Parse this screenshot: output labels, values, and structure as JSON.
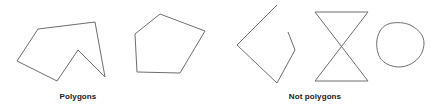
{
  "figure": {
    "width": 437,
    "height": 109,
    "background_color": "#ffffff",
    "stroke_color": "#6e6e6e",
    "text_color": "#1a1a1a"
  },
  "captions": {
    "left": "Polygons",
    "right": "Not polygons"
  },
  "groups": [
    {
      "name": "polygons",
      "caption": "Polygons",
      "shapes": [
        {
          "name": "concave-heptagon",
          "kind": "closed-polygon",
          "closed": true,
          "points": [
            [
              38,
              29
            ],
            [
              95,
              22
            ],
            [
              105,
              77
            ],
            [
              78,
              50
            ],
            [
              57,
              81
            ],
            [
              17,
              61
            ]
          ],
          "path": "M 38 29 L 95 22 L 105 77 L 78 50 L 57 81 L 17 61 Z"
        },
        {
          "name": "convex-pentagon",
          "kind": "closed-polygon",
          "closed": true,
          "points": [
            [
              160,
              14
            ],
            [
              205,
              31
            ],
            [
              180,
              73
            ],
            [
              137,
              72
            ],
            [
              135,
              34
            ]
          ],
          "path": "M 160 14 L 205 31 L 180 73 L 137 72 L 135 34 Z"
        }
      ]
    },
    {
      "name": "not-polygons",
      "caption": "Not polygons",
      "shapes": [
        {
          "name": "open-quadrilateral",
          "kind": "open-figure",
          "closed": false,
          "points": [
            [
              277,
              5
            ],
            [
              237,
              45
            ],
            [
              277,
              83
            ],
            [
              295,
              50
            ],
            [
              288,
              32
            ]
          ],
          "path": "M 277 5 L 237 45 L 277 83 L 295 50 L 288 32"
        },
        {
          "name": "self-intersecting-bowtie",
          "kind": "self-intersecting",
          "closed": true,
          "points": [
            [
              315,
              12
            ],
            [
              368,
              12
            ],
            [
              315,
              81
            ],
            [
              368,
              81
            ]
          ],
          "path": "M 315 12 L 368 12 L 315 81 L 368 81 Z"
        },
        {
          "name": "curved-blob",
          "kind": "curved-figure",
          "closed": true,
          "path": "M 392 23 C 400 22 407 23 412 26 C 419 30 424 36 424 43 C 424 50 421 57 414 62 C 407 67 399 68 392 66 C 385 64 380 60 378 53 C 376 46 376 38 380 31 C 383 26 387 24 392 23 Z"
        }
      ]
    }
  ]
}
